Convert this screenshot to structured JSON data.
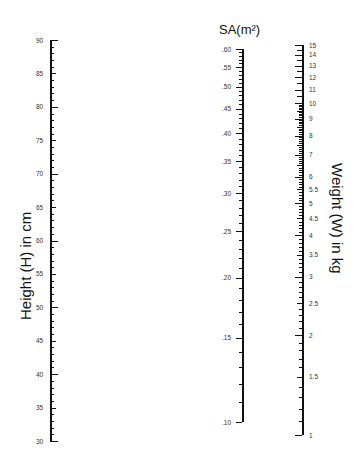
{
  "nomogram": {
    "height_scale": {
      "title": "Height (H) in cm",
      "min": 30,
      "max": 90,
      "major_ticks": [
        90,
        85,
        80,
        75,
        70,
        65,
        60,
        55,
        50,
        45,
        40,
        35,
        30
      ],
      "labels": [
        "90",
        "85",
        "80",
        "75",
        "70",
        "65",
        "60",
        "55",
        "50",
        "45",
        "40",
        "35",
        "30"
      ]
    },
    "sa_scale": {
      "title": "SA(m²)",
      "min": 0.1,
      "max": 0.6,
      "labels": [
        ".60",
        ".55",
        ".50",
        ".45",
        ".40",
        ".35",
        ".30",
        ".25",
        ".20",
        ".15",
        ".10"
      ],
      "values": [
        0.6,
        0.55,
        0.5,
        0.45,
        0.4,
        0.35,
        0.3,
        0.25,
        0.2,
        0.15,
        0.1
      ]
    },
    "weight_scale": {
      "title": "Weight (W) in kg",
      "min": 1,
      "max": 15,
      "labels": [
        "15",
        "14",
        "13",
        "12",
        "11",
        "10",
        "9",
        "8",
        "7",
        "6",
        "5.5",
        "5",
        "4.5",
        "4",
        "3.5",
        "3",
        "2.5",
        "2",
        "1.5",
        "1"
      ],
      "values": [
        15,
        14,
        13,
        12,
        11,
        10,
        9,
        8,
        7,
        6,
        5.5,
        5,
        4.5,
        4,
        3.5,
        3,
        2.5,
        2,
        1.5,
        1
      ]
    }
  }
}
